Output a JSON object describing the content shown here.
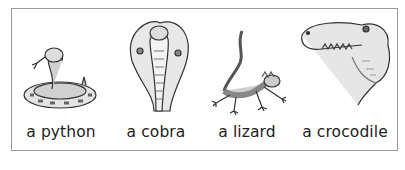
{
  "panel": {
    "items": [
      {
        "label": "a python",
        "icon": "python-snake-icon"
      },
      {
        "label": "a cobra",
        "icon": "cobra-icon"
      },
      {
        "label": "a lizard",
        "icon": "lizard-icon"
      },
      {
        "label": "a crocodile",
        "icon": "crocodile-icon"
      }
    ]
  },
  "colors": {
    "border": "#9a9a9a",
    "text": "#222222",
    "ink": "#333333",
    "shade": "#9a9a9a"
  }
}
